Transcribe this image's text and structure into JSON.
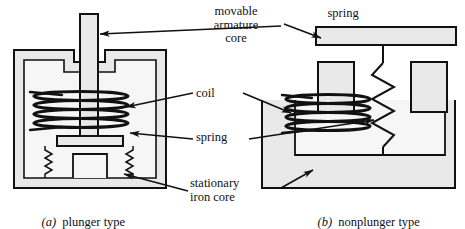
{
  "figure": {
    "background_color": "#ffffff",
    "line_color": "#111111",
    "metal_fill_color": "#e8e8e8"
  },
  "labels": {
    "movable_armature_core": "movable\narmature\ncore",
    "spring_top": "spring",
    "coil": "coil",
    "spring_middle": "spring",
    "stationary_iron_core": "stationary\niron core"
  },
  "captions": {
    "left_letter": "(a)",
    "left_text": "plunger type",
    "right_letter": "(b)",
    "right_text": "nonplunger type"
  },
  "diagram_a": {
    "name": "plunger type solenoid",
    "parts": [
      "movable plunger armature",
      "stationary iron core shell",
      "coil winding",
      "return springs",
      "plunger flange",
      "center pedestal"
    ],
    "coil_turns": 4,
    "spring_count": 2
  },
  "diagram_b": {
    "name": "nonplunger type solenoid",
    "parts": [
      "movable armature bar",
      "stationary iron core",
      "coil winding",
      "return spring",
      "left core leg",
      "right core leg",
      "center post"
    ],
    "coil_turns": 4,
    "spring_count": 1
  }
}
